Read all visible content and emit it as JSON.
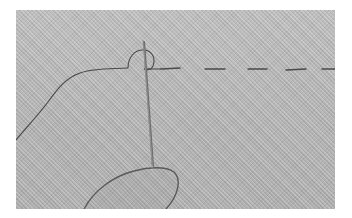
{
  "image": {
    "subject": "hand sewing: needle pulling thread through fabric with running stitch",
    "alt": "Grayscale close-up of a needle being pushed through twill fabric by a fingertip, with a dashed running stitch extending to the right and a loose thread curving to the left",
    "colors": {
      "background": "#ffffff",
      "fabric": "#b9b9b9",
      "thread": "#4a4a4a",
      "needle": "#6e6e6e",
      "needle_highlight": "#e8e8e8"
    },
    "elements": [
      "fabric-background",
      "running-stitch",
      "loose-thread",
      "thread-loop",
      "needle",
      "fingertip-outline"
    ]
  }
}
